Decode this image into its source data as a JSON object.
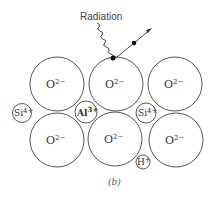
{
  "diagram": {
    "title": "Radiation",
    "caption": "(b)",
    "oxygen_label": "O",
    "oxygen_charge": "2−",
    "ions": {
      "si_left": {
        "symbol": "Si",
        "charge": "4+"
      },
      "al": {
        "symbol": "Al",
        "charge": "3+"
      },
      "si_right": {
        "symbol": "Si",
        "charge": "4+"
      },
      "h": {
        "symbol": "H",
        "charge": "+"
      }
    },
    "oxygen_ions": [
      {
        "id": "top-left",
        "cx": 57,
        "cy": 84,
        "r": 27
      },
      {
        "id": "top-middle",
        "cx": 116,
        "cy": 84,
        "r": 27
      },
      {
        "id": "top-right",
        "cx": 175,
        "cy": 84,
        "r": 27
      },
      {
        "id": "bottom-left",
        "cx": 57,
        "cy": 140,
        "r": 27
      },
      {
        "id": "bottom-middle",
        "cx": 115,
        "cy": 139,
        "r": 27
      },
      {
        "id": "bottom-right",
        "cx": 176,
        "cy": 140,
        "r": 27
      }
    ]
  }
}
